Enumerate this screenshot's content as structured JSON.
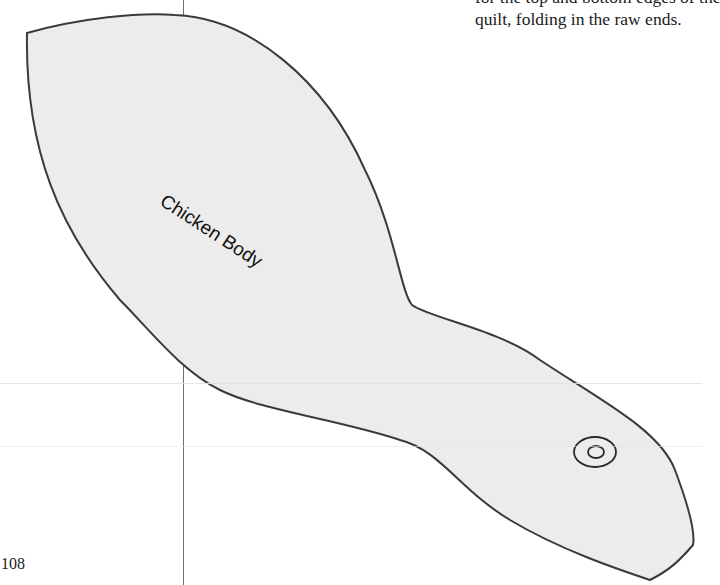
{
  "page": {
    "number": "108",
    "body_text_lines": [
      "for the top and bottom edges of the",
      "quilt, folding in the raw ends."
    ]
  },
  "pattern": {
    "label": "Chicken Body",
    "fill_color": "#ececec",
    "outline_color": "#3a3a3a",
    "features": [
      "eye-marking"
    ]
  }
}
